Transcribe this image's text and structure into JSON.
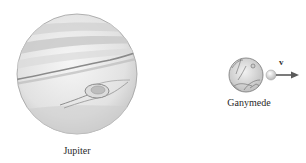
{
  "figure": {
    "bodies": [
      {
        "name": "Jupiter",
        "label": "Jupiter"
      },
      {
        "name": "Ganymede",
        "label": "Ganymede"
      }
    ],
    "velocity_vector": {
      "label": "v"
    }
  },
  "colors": {
    "planet_fill": "#e8e8e8",
    "planet_band": "#a9a9a9",
    "outline": "#9a9a9a",
    "arrow": "#5a5a5a",
    "text": "#2a2a2a"
  }
}
